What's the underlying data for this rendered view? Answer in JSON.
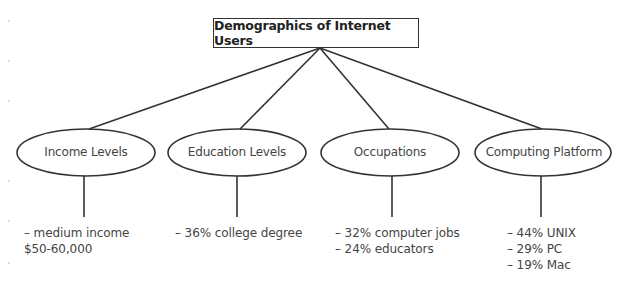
{
  "title": "Demographics of Internet Users",
  "nodes": [
    {
      "label": "Income Levels",
      "items": [
        "– medium income",
        "$50-60,000"
      ]
    },
    {
      "label": "Education Levels",
      "items": [
        "– 36% college degree"
      ]
    },
    {
      "label": "Occupations",
      "items": [
        "– 32% computer jobs",
        "– 24% educators"
      ]
    },
    {
      "label": "Computing Platform",
      "items": [
        "– 44% UNIX",
        "– 29% PC",
        "– 19% Mac"
      ]
    }
  ],
  "colors": {
    "stroke": "#333333",
    "text": "#444444",
    "background": "#ffffff"
  }
}
